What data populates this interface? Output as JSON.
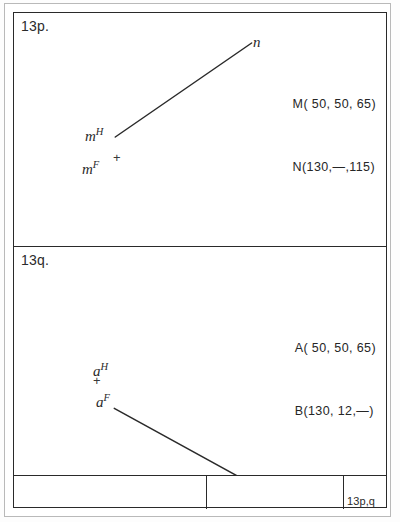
{
  "sheet": {
    "ink_color": "#2a2a2a",
    "paper_color": "#ffffff"
  },
  "panels": [
    {
      "label": "13p.",
      "coordinates": [
        "M( 50, 50, 65)",
        "N(130,—,115)"
      ],
      "points": [
        {
          "base": "m",
          "sup": "H"
        },
        {
          "base": "m",
          "sup": "F"
        },
        {
          "base": "n",
          "sup": ""
        }
      ],
      "plus_mark": "+",
      "line": {
        "from": "m",
        "to": "n"
      }
    },
    {
      "label": "13q.",
      "coordinates": [
        "A( 50, 50, 65)",
        "B(130, 12,—)"
      ],
      "points": [
        {
          "base": "a",
          "sup": "H"
        },
        {
          "base": "a",
          "sup": "F"
        },
        {
          "base": "b",
          "sup": ""
        }
      ],
      "plus_mark": "+",
      "line": {
        "from": "a",
        "to": "b"
      }
    }
  ],
  "title_block": {
    "left_cell": "",
    "middle_cell": "",
    "right_cell": "13p,q"
  }
}
